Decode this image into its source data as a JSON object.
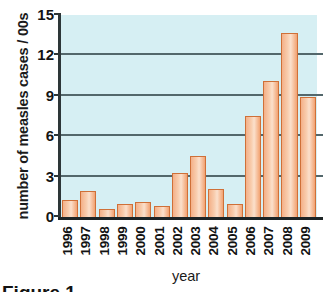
{
  "chart_data": {
    "type": "bar",
    "title": "",
    "xlabel": "year",
    "ylabel": "number of measles cases / 00s",
    "categories": [
      "1996",
      "1997",
      "1998",
      "1999",
      "2000",
      "2001",
      "2002",
      "2003",
      "2004",
      "2005",
      "2006",
      "2007",
      "2008",
      "2009"
    ],
    "values": [
      1.3,
      1.9,
      0.6,
      0.95,
      1.1,
      0.8,
      3.3,
      4.5,
      2.1,
      1.0,
      7.5,
      10.1,
      13.7,
      8.9
    ],
    "yticks": [
      0,
      3,
      6,
      9,
      12,
      15
    ],
    "ylim": [
      0,
      15
    ],
    "grid": "horizontal",
    "legend": "none",
    "series_name": "measles cases",
    "colors": {
      "bar_fill": "#f6bf97",
      "bar_edge": "#cf7038",
      "plot_background": "#d6eff3",
      "axis": "#1d2426",
      "gridline": "#53676b",
      "text": "#131313"
    }
  },
  "caption": {
    "text": "Figure 1"
  }
}
